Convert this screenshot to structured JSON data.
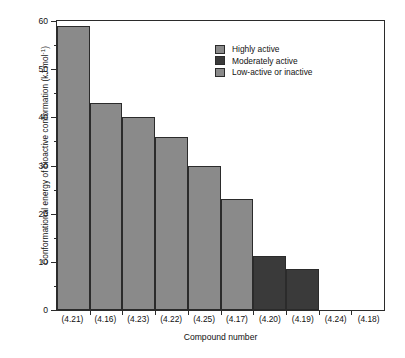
{
  "chart_data": {
    "type": "bar",
    "title": "",
    "xlabel": "Compound number",
    "ylabel": "Conformational energy of bioactive conformation (kJ mol",
    "ylabel_sup": "-1",
    "ylabel_tail": ")",
    "categories": [
      "(4.21)",
      "(4.16)",
      "(4.23)",
      "(4.22)",
      "(4.25)",
      "(4.17)",
      "(4.20)",
      "(4.19)",
      "(4.24)",
      "(4.18)"
    ],
    "values": [
      59,
      43,
      40,
      36,
      30,
      23,
      11.3,
      8.5,
      0,
      0
    ],
    "groups": [
      "Highly active",
      "Highly active",
      "Highly active",
      "Highly active",
      "Highly active",
      "Highly active",
      "Moderately active",
      "Moderately active",
      "Low-active or inactive",
      "Low-active or inactive"
    ],
    "bar_colors": [
      "#8a8a8a",
      "#8a8a8a",
      "#8a8a8a",
      "#8a8a8a",
      "#8a8a8a",
      "#8a8a8a",
      "#3a3a3a",
      "#3a3a3a",
      "#8a8a8a",
      "#8a8a8a"
    ],
    "ylim": [
      0,
      60
    ],
    "yticks": [
      0,
      10,
      20,
      30,
      40,
      50,
      60
    ],
    "yticks_minor": [
      5,
      15,
      25,
      35,
      45,
      55
    ],
    "ytick_labels": [
      "0",
      "10",
      "20",
      "30",
      "40",
      "50",
      "60"
    ],
    "grid": false,
    "legend_position": "top-right",
    "legend": [
      {
        "label": "Highly active",
        "color": "#8a8a8a"
      },
      {
        "label": "Moderately active",
        "color": "#3a3a3a"
      },
      {
        "label": "Low-active or inactive",
        "color": "#8a8a8a"
      }
    ],
    "axis_color": "#2b2b2b",
    "background": "#ffffff"
  }
}
